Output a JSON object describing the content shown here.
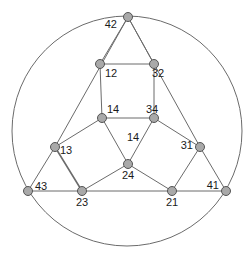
{
  "figure": {
    "background_color": "#ffffff",
    "width": 252,
    "height": 261
  },
  "style": {
    "circle_stroke": "#6b6b6b",
    "circle_stroke_width": 1,
    "edge_stroke": "#6b6b6b",
    "edge_stroke_width": 1,
    "edge_stroke_bold": 1.6,
    "node_fill": "#a9a9a9",
    "node_stroke": "#555555",
    "node_stroke_width": 1,
    "node_radius": 4.5,
    "label_color": "#1a1a1a",
    "label_font_size": 11
  },
  "chart_data": {
    "type": "diagram",
    "subtype": "node-link-graph",
    "title": "",
    "circle": {
      "cx": 127,
      "cy": 131,
      "r": 115
    },
    "nodes": [
      {
        "id": "42",
        "label": "42",
        "x": 128,
        "y": 17,
        "label_x": 117,
        "label_y": 25,
        "anchor": "end"
      },
      {
        "id": "12",
        "label": "12",
        "x": 100,
        "y": 64,
        "label_x": 105,
        "label_y": 74,
        "anchor": "start"
      },
      {
        "id": "32",
        "label": "32",
        "x": 154,
        "y": 64,
        "label_x": 152,
        "label_y": 74,
        "anchor": "start"
      },
      {
        "id": "14",
        "label": "14",
        "x": 102,
        "y": 118,
        "label_x": 107,
        "label_y": 110,
        "anchor": "start"
      },
      {
        "id": "34",
        "label": "34",
        "x": 154,
        "y": 118,
        "label_x": 146,
        "label_y": 110,
        "anchor": "start"
      },
      {
        "id": "13",
        "label": "13",
        "x": 55,
        "y": 147,
        "label_x": 60,
        "label_y": 151,
        "anchor": "start"
      },
      {
        "id": "31",
        "label": "31",
        "x": 200,
        "y": 147,
        "label_x": 193,
        "label_y": 146,
        "anchor": "end"
      },
      {
        "id": "24",
        "label": "24",
        "x": 128,
        "y": 164,
        "label_x": 128,
        "label_y": 176,
        "anchor": "middle"
      },
      {
        "id": "43",
        "label": "43",
        "x": 28,
        "y": 191,
        "label_x": 35,
        "label_y": 187,
        "anchor": "start"
      },
      {
        "id": "23",
        "label": "23",
        "x": 82,
        "y": 191,
        "label_x": 82,
        "label_y": 203,
        "anchor": "middle"
      },
      {
        "id": "21",
        "label": "21",
        "x": 172,
        "y": 191,
        "label_x": 172,
        "label_y": 203,
        "anchor": "middle"
      },
      {
        "id": "41",
        "label": "41",
        "x": 226,
        "y": 191,
        "label_x": 219,
        "label_y": 186,
        "anchor": "end"
      }
    ],
    "edge_labels": [
      {
        "text": "14",
        "x": 133,
        "y": 138,
        "anchor": "middle"
      }
    ],
    "edges": [
      {
        "from": "42",
        "to": "12",
        "bold": false
      },
      {
        "from": "42",
        "to": "32",
        "bold": false
      },
      {
        "from": "12",
        "to": "32",
        "bold": false
      },
      {
        "from": "12",
        "to": "14",
        "bold": false
      },
      {
        "from": "32",
        "to": "34",
        "bold": false
      },
      {
        "from": "14",
        "to": "34",
        "bold": false
      },
      {
        "from": "42",
        "to": "13",
        "bold": false
      },
      {
        "from": "42",
        "to": "31",
        "bold": false
      },
      {
        "from": "13",
        "to": "14",
        "bold": false
      },
      {
        "from": "34",
        "to": "31",
        "bold": false
      },
      {
        "from": "14",
        "to": "24",
        "bold": false
      },
      {
        "from": "34",
        "to": "24",
        "bold": false
      },
      {
        "from": "13",
        "to": "43",
        "bold": false
      },
      {
        "from": "13",
        "to": "23",
        "bold": true
      },
      {
        "from": "23",
        "to": "24",
        "bold": false
      },
      {
        "from": "24",
        "to": "21",
        "bold": false
      },
      {
        "from": "21",
        "to": "31",
        "bold": false
      },
      {
        "from": "31",
        "to": "41",
        "bold": false
      },
      {
        "from": "43",
        "to": "23",
        "bold": false
      },
      {
        "from": "23",
        "to": "21",
        "bold": false
      },
      {
        "from": "21",
        "to": "41",
        "bold": false
      }
    ]
  }
}
